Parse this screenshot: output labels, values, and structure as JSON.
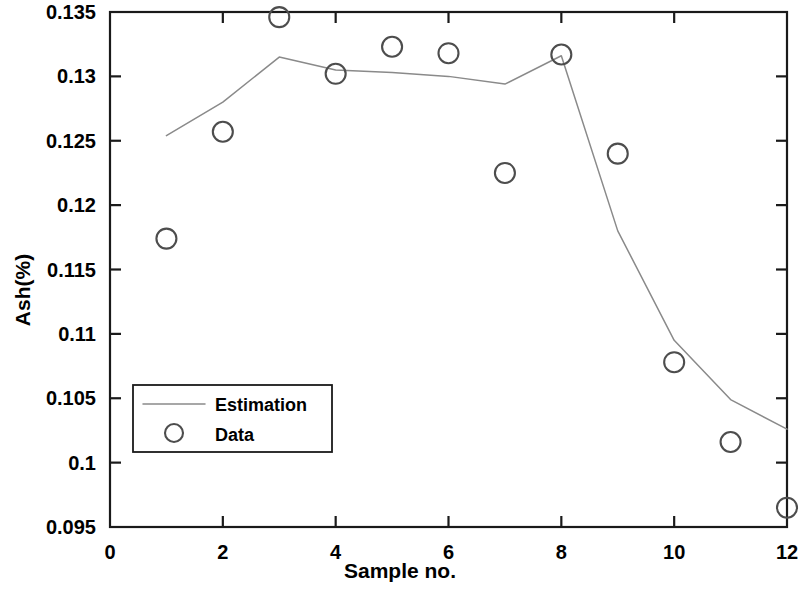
{
  "chart_data": {
    "type": "line",
    "title": "",
    "xlabel": "Sample no.",
    "ylabel": "Ash(%)",
    "xlim": [
      0,
      12
    ],
    "ylim": [
      0.095,
      0.135
    ],
    "xticks": [
      0,
      2,
      4,
      6,
      8,
      10,
      12
    ],
    "xtick_labels": [
      "0",
      "2",
      "4",
      "6",
      "8",
      "10",
      "12"
    ],
    "yticks": [
      0.095,
      0.1,
      0.105,
      0.11,
      0.115,
      0.12,
      0.125,
      0.13,
      0.135
    ],
    "ytick_labels": [
      "0.095",
      "0.1",
      "0.105",
      "0.11",
      "0.115",
      "0.12",
      "0.125",
      "0.13",
      "0.135"
    ],
    "grid": false,
    "legend_position": "center-left",
    "x": [
      1,
      2,
      3,
      4,
      5,
      6,
      7,
      8,
      9,
      10,
      11,
      12
    ],
    "series": [
      {
        "name": "Estimation",
        "style": "line",
        "color": "#8a8a8a",
        "values": [
          0.1254,
          0.128,
          0.1315,
          0.1305,
          0.1303,
          0.13,
          0.1294,
          0.1316,
          0.118,
          0.1095,
          0.1049,
          0.1026
        ]
      },
      {
        "name": "Data",
        "style": "marker-circle",
        "color": "#4d4d4d",
        "values": [
          0.1174,
          0.1257,
          0.1346,
          0.1302,
          0.1323,
          0.1318,
          0.1225,
          0.1317,
          0.124,
          0.1078,
          0.1016,
          0.0965
        ]
      }
    ]
  },
  "legend": {
    "entries": [
      {
        "label": "Estimation"
      },
      {
        "label": "Data"
      }
    ]
  }
}
